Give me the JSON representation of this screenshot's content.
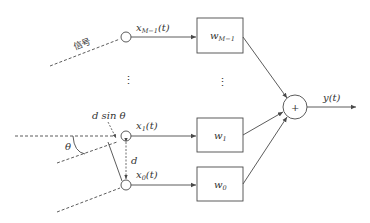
{
  "diagram": {
    "type": "uniform-linear-array-beamformer",
    "colors": {
      "stroke": "#4a4a4a",
      "text": "#333333",
      "background": "#ffffff"
    },
    "signal_label": "信号",
    "sensors": [
      {
        "id": "xM-1",
        "label_main": "x",
        "label_sub": "M−1",
        "label_tail": "(t)"
      },
      {
        "id": "x1",
        "label_main": "x",
        "label_sub": "1",
        "label_tail": "(t)"
      },
      {
        "id": "x0",
        "label_main": "x",
        "label_sub": "0",
        "label_tail": "(t)"
      }
    ],
    "weights": [
      {
        "id": "wM-1",
        "label_main": "w",
        "label_sub": "M−1"
      },
      {
        "id": "w1",
        "label_main": "w",
        "label_sub": "1"
      },
      {
        "id": "w0",
        "label_main": "w",
        "label_sub": "0"
      }
    ],
    "ellipsis": "⋮",
    "summer_symbol": "+",
    "output_label": "y(t)",
    "spacing_label": "d",
    "path_diff_label": "d sin θ",
    "angle_label": "θ"
  }
}
